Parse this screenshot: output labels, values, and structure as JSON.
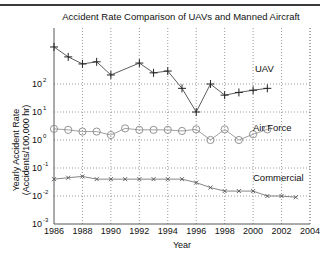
{
  "chart_data": {
    "type": "line",
    "title": "Accident Rate Comparison of UAVs and Manned Aircraft",
    "xlabel": "Year",
    "ylabel": "Yearly Accident Rate",
    "ylabel_units": "(Accidents/100,000 hr)",
    "yscale": "log",
    "xlim": [
      1986,
      2004
    ],
    "ylim": [
      0.001,
      10000
    ],
    "grid": true,
    "x_ticks": [
      1986,
      1988,
      1990,
      1992,
      1994,
      1996,
      1998,
      2000,
      2002,
      2004
    ],
    "y_ticks": [
      {
        "base": "10",
        "exp": "-3",
        "value": 0.001
      },
      {
        "base": "10",
        "exp": "-2",
        "value": 0.01
      },
      {
        "base": "10",
        "exp": "-1",
        "value": 0.1
      },
      {
        "base": "10",
        "exp": "0",
        "value": 1
      },
      {
        "base": "10",
        "exp": "1",
        "value": 10
      },
      {
        "base": "10",
        "exp": "2",
        "value": 100
      }
    ],
    "legend_position": "inline labels at right",
    "series": [
      {
        "name": "UAV",
        "marker": "plus",
        "color": "#333333",
        "x": [
          1986,
          1987,
          1988,
          1989,
          1990,
          1992,
          1993,
          1994,
          1995,
          1996,
          1997,
          1998,
          1999,
          2000,
          2001
        ],
        "values": [
          2100,
          930,
          520,
          620,
          210,
          560,
          250,
          290,
          70,
          10,
          100,
          40,
          50,
          60,
          70
        ]
      },
      {
        "name": "Air Force",
        "marker": "circle",
        "color": "#888888",
        "x": [
          1986,
          1987,
          1988,
          1989,
          1990,
          1991,
          1992,
          1993,
          1994,
          1995,
          1996,
          1997,
          1998,
          1999,
          2000,
          2001
        ],
        "values": [
          2.5,
          2.3,
          2.0,
          2.0,
          1.5,
          2.6,
          2.3,
          2.3,
          2.3,
          2.1,
          2.4,
          1.0,
          2.4,
          1.0,
          1.6,
          2.4
        ]
      },
      {
        "name": "Commercial",
        "marker": "x",
        "color": "#666666",
        "x": [
          1986,
          1987,
          1988,
          1989,
          1990,
          1991,
          1992,
          1993,
          1994,
          1995,
          1996,
          1997,
          1998,
          1999,
          2000,
          2001,
          2002,
          2003
        ],
        "values": [
          0.04,
          0.045,
          0.05,
          0.04,
          0.04,
          0.04,
          0.04,
          0.04,
          0.04,
          0.04,
          0.03,
          0.02,
          0.015,
          0.015,
          0.015,
          0.01,
          0.01,
          0.009
        ]
      }
    ]
  }
}
